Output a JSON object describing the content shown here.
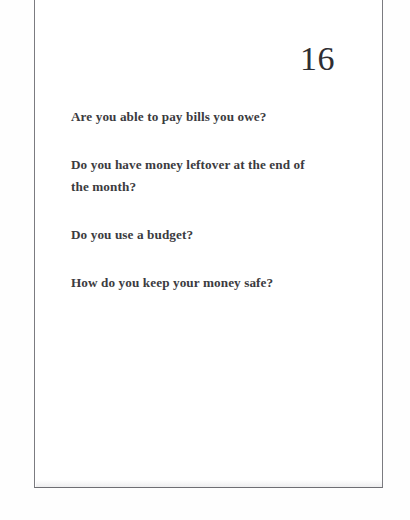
{
  "document": {
    "kind": "scanned-worksheet-page",
    "page_number": "16",
    "questions": [
      {
        "text": "Are you able to pay bills you owe?"
      },
      {
        "text": "Do you have money leftover at the end of the month?"
      },
      {
        "text": "Do you use a budget?"
      },
      {
        "text": "How do you keep your money safe?"
      }
    ],
    "colors": {
      "page_background": "#ffffff",
      "scan_background": "#fefefe",
      "text": "#3b3b40",
      "page_number_text": "#2e2e33",
      "frame_rule": "#7b7b80"
    }
  }
}
